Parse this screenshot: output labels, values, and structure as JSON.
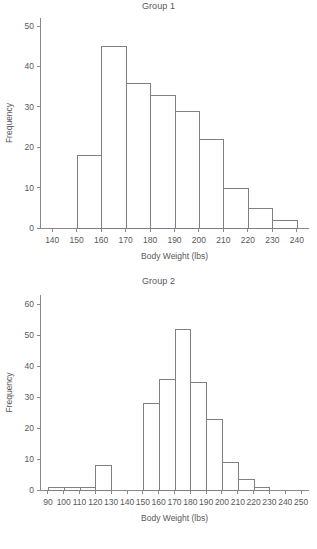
{
  "figure": {
    "background_color": "#ffffff",
    "line_color": "#808083",
    "text_color": "#58585a"
  },
  "charts": [
    {
      "title": "Group 1",
      "xlabel": "Body Weight (lbs)",
      "ylabel": "Frequency",
      "xticks": [
        "140",
        "150",
        "160",
        "170",
        "180",
        "190",
        "200",
        "210",
        "220",
        "230",
        "240"
      ],
      "yticks": [
        "0",
        "10",
        "20",
        "30",
        "40",
        "50"
      ]
    },
    {
      "title": "Group 2",
      "xlabel": "Body Weight (lbs)",
      "ylabel": "Frequency",
      "xticks": [
        "90",
        "100",
        "110",
        "120",
        "130",
        "140",
        "150",
        "160",
        "170",
        "180",
        "190",
        "200",
        "210",
        "220",
        "230",
        "240",
        "250"
      ],
      "yticks": [
        "0",
        "10",
        "20",
        "30",
        "40",
        "50",
        "60"
      ]
    }
  ],
  "chart_data": [
    {
      "type": "bar",
      "title": "Group 1",
      "xlabel": "Body Weight (lbs)",
      "ylabel": "Frequency",
      "grid": false,
      "legend": "none",
      "xlim": [
        135,
        245
      ],
      "ylim": [
        0,
        52
      ],
      "xticks": [
        140,
        150,
        160,
        170,
        180,
        190,
        200,
        210,
        220,
        230,
        240
      ],
      "yticks": [
        0,
        10,
        20,
        30,
        40,
        50
      ],
      "bin_edges": [
        150,
        160,
        170,
        180,
        190,
        200,
        210,
        220,
        230,
        240
      ],
      "categories": [
        "150-160",
        "160-170",
        "170-180",
        "180-190",
        "190-200",
        "200-210",
        "210-220",
        "220-230",
        "230-240"
      ],
      "values": [
        18,
        45,
        36,
        33,
        29,
        22,
        10,
        5,
        2
      ]
    },
    {
      "type": "bar",
      "title": "Group 2",
      "xlabel": "Body Weight (lbs)",
      "ylabel": "Frequency",
      "grid": false,
      "legend": "none",
      "xlim": [
        85,
        255
      ],
      "ylim": [
        0,
        63
      ],
      "xticks": [
        90,
        100,
        110,
        120,
        130,
        140,
        150,
        160,
        170,
        180,
        190,
        200,
        210,
        220,
        230,
        240,
        250
      ],
      "yticks": [
        0,
        10,
        20,
        30,
        40,
        50,
        60
      ],
      "bin_edges": [
        90,
        100,
        110,
        120,
        150,
        160,
        170,
        180,
        190,
        200,
        210,
        220,
        230,
        240
      ],
      "categories": [
        "90-100",
        "100-110",
        "110-120",
        "150-160",
        "160-170",
        "170-180",
        "180-190",
        "190-200",
        "200-210",
        "210-220",
        "220-230",
        "230-240"
      ],
      "values": [
        1,
        1,
        1,
        8,
        28,
        36,
        52,
        35,
        23,
        9,
        3.5,
        1
      ]
    }
  ]
}
